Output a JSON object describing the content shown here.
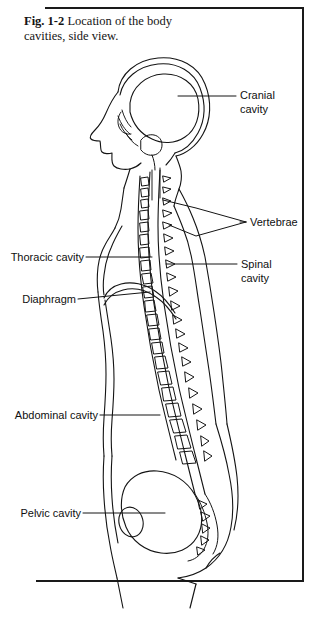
{
  "figure": {
    "caption_number": "Fig. 1-2",
    "caption_text": " Location of the body cavities, side view.",
    "ink_color": "#141414",
    "background_color": "#ffffff"
  },
  "labels": {
    "cranial_cavity": "Cranial\ncavity",
    "vertebrae": "Vertebrae",
    "spinal_cavity": "Spinal\ncavity",
    "thoracic_cavity": "Thoracic cavity",
    "diaphragm": "Diaphragm",
    "abdominal_cavity": "Abdominal cavity",
    "pelvic_cavity": "Pelvic cavity"
  }
}
